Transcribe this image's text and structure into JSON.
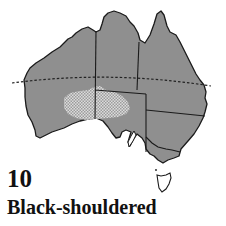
{
  "map": {
    "region": "Australia",
    "land_color": "#8f8f8f",
    "outline_color": "#1a1a1a",
    "range_fill_color": "#d9d9d9",
    "range_hatch_color": "#9a9a9a",
    "tropic_line": "dashed",
    "range_area": "Central / inland Western & South Australia (hatched)"
  },
  "caption": {
    "number": "10",
    "name": "Black-shouldered"
  }
}
